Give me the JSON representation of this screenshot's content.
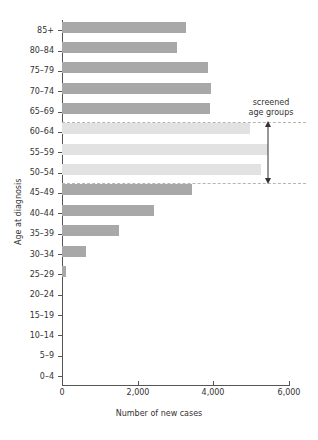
{
  "chart_data": {
    "type": "bar",
    "orientation": "horizontal",
    "title": "",
    "xlabel": "Number of new cases",
    "ylabel": "Age at diagnosis",
    "xlim": [
      0,
      6000
    ],
    "xticks": [
      0,
      2000,
      4000,
      6000
    ],
    "xtick_labels": [
      "0",
      "2,000",
      "4,000",
      "6,000"
    ],
    "grid": false,
    "legend": "none",
    "categories": [
      "0–4",
      "5–9",
      "10–14",
      "15–19",
      "20–24",
      "25–29",
      "30–34",
      "35–39",
      "40–44",
      "45–49",
      "50–54",
      "55–59",
      "60–64",
      "65–69",
      "70–74",
      "75–79",
      "80–84",
      "85+"
    ],
    "values": [
      0,
      0,
      0,
      0,
      0,
      110,
      630,
      1500,
      2420,
      3430,
      5260,
      5450,
      4970,
      3900,
      3940,
      3870,
      3050,
      3270
    ],
    "highlight_categories": [
      "50–54",
      "55–59",
      "60–64"
    ],
    "colors": {
      "bar": "#a8a8a8",
      "bar_highlight": "#e2e2e2",
      "axis": "#555555",
      "dashed": "#b5b5b5",
      "text": "#333333"
    },
    "annotations": [
      {
        "name": "screened-age-groups",
        "line1": "screened",
        "line2": "age groups",
        "spans": [
          "50–54",
          "55–59",
          "60–64"
        ]
      }
    ]
  }
}
